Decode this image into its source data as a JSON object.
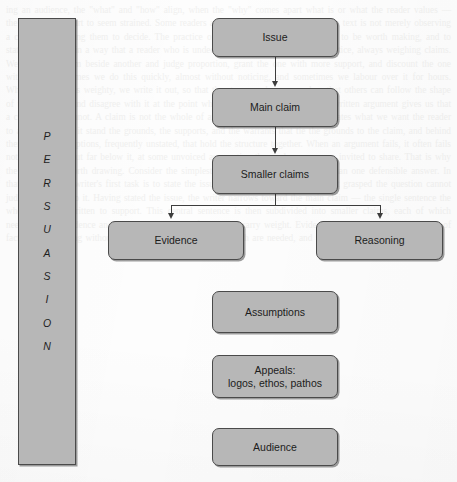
{
  "page": {
    "width": 457,
    "height": 482,
    "background_color": "#fdfdfd",
    "box_fill_color": "#b7b7b7",
    "box_border_color": "#4a4a4a",
    "connector_color": "#3d3d3d",
    "text_color": "#1c1c1c"
  },
  "sidebar": {
    "name": "persuasion-bar",
    "word": "PERSUASION",
    "letters": [
      "P",
      "E",
      "R",
      "S",
      "U",
      "A",
      "S",
      "I",
      "O",
      "N"
    ],
    "orientation": "vertical",
    "font_style": "italic"
  },
  "diagram": {
    "type": "flowchart",
    "nodes": [
      {
        "id": "issue",
        "label": "Issue",
        "x": 212,
        "y": 18,
        "w": 126,
        "h": 39
      },
      {
        "id": "main-claim",
        "label": "Main claim",
        "x": 212,
        "y": 88,
        "w": 126,
        "h": 39
      },
      {
        "id": "smaller-claims",
        "label": "Smaller claims",
        "x": 212,
        "y": 155,
        "w": 126,
        "h": 39
      },
      {
        "id": "evidence",
        "label": "Evidence",
        "x": 108,
        "y": 221,
        "w": 136,
        "h": 39
      },
      {
        "id": "reasoning",
        "label": "Reasoning",
        "x": 316,
        "y": 221,
        "w": 127,
        "h": 39
      },
      {
        "id": "assumptions",
        "label": "Assumptions",
        "x": 212,
        "y": 291,
        "w": 126,
        "h": 42
      },
      {
        "id": "appeals",
        "label": "Appeals:\nlogos, ethos, pathos",
        "x": 212,
        "y": 355,
        "w": 126,
        "h": 43
      },
      {
        "id": "audience",
        "label": "Audience",
        "x": 212,
        "y": 428,
        "w": 126,
        "h": 38
      }
    ],
    "edges": [
      {
        "from": "issue",
        "to": "main-claim",
        "style": "straight-arrow-down"
      },
      {
        "from": "main-claim",
        "to": "smaller-claims",
        "style": "straight-arrow-down"
      },
      {
        "from": "smaller-claims",
        "to": "evidence",
        "style": "split-bus-arrow-down"
      },
      {
        "from": "smaller-claims",
        "to": "reasoning",
        "style": "split-bus-arrow-down"
      }
    ]
  },
  "ghost_text": {
    "note": "faint show-through of printed book page behind the diagram",
    "lines": [
      "ing an audience, the \"what\" and \"how\" align, when the \"why\" comes apart",
      "what is or what the reader values — the writing can start to seem strained.",
      "Some readers are put off by the feeling that the text is not merely observing",
      "a case but is asking them to decide. The practice of argument is to name",
      "a choice to be worth making, and to state the grounds in a way that a reader",
      "who is undecided can weigh.",
      "We are, in practice, always weighing claims. We hold one claim beside",
      "another and judge proportion, grant the one with more support, and discount",
      "the one with less. Sometimes we do this quickly, almost without noticing,",
      "and sometimes we labour over it for hours. When the matter is weighty, we",
      "write it out, so that the steps can be seen and so that others can follow",
      "the shape of the reasoning and disagree with it at the point where they differ.",
      "That is what a written argument gives us that a conversation cannot.",
      "A claim is not the whole of an argument. It is the part that states what",
      "we want the reader to accept. Around it stand the grounds, the supports,",
      "and the warrants that tie the grounds to the claim, and behind them all",
      "sit assumptions, frequently unstated, that hold the structure together.",
      "When an argument fails, it often fails not at the claim but far below it,",
      "at some unvoiced assumption the reader was never invited to share.",
      "That is why the diagram is worth drawing.",
      "Consider the simplest case: an issue that has more than one defensible",
      "answer. In that situation the writer's first task is to state the issue,",
      "because a reader who has not grasped the question cannot judge an answer",
      "to it. Having stated the issue, the writer narrows toward the main claim —",
      "the single sentence the whole piece is written to support. This central",
      "sentence is then subdivided into smaller claims, each of which needs its",
      "own evidence and its own reasoning before it will carry weight. Evidence",
      "without reasoning is a heap of facts, and reasoning without evidence is",
      "merely assertion. Both are needed, and they must be joined."
    ]
  }
}
